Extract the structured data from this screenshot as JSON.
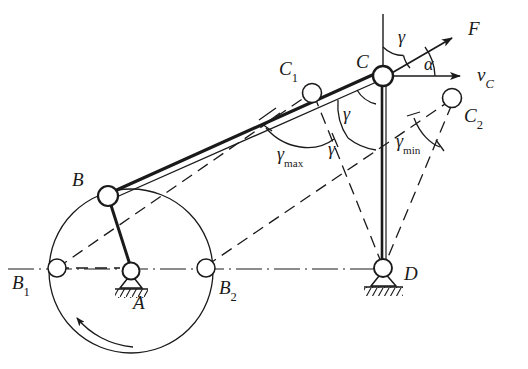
{
  "diagram": {
    "type": "mechanism-kinematic-diagram",
    "stroke_color": "#1a1a1a",
    "background": "#ffffff",
    "labels": {
      "A": "A",
      "B": "B",
      "B1_base": "B",
      "B1_sub": "1",
      "B2_base": "B",
      "B2_sub": "2",
      "C": "C",
      "C1_base": "C",
      "C1_sub": "1",
      "C2_base": "C",
      "C2_sub": "2",
      "D": "D",
      "F": "F",
      "vC_base": "v",
      "vC_sub": "C",
      "gamma_top": "γ",
      "gamma_upper": "γ",
      "gamma_lower": "γ",
      "gamma_max_base": "γ",
      "gamma_max_sub": "max",
      "gamma_min_base": "γ",
      "gamma_min_sub": "min",
      "alpha": "α"
    },
    "points": {
      "A": {
        "x": 131,
        "y": 271,
        "kind": "fixed-pivot"
      },
      "D": {
        "x": 383,
        "y": 268,
        "kind": "fixed-pivot"
      },
      "B": {
        "x": 108,
        "y": 196,
        "kind": "moving-joint"
      },
      "C": {
        "x": 383,
        "y": 76,
        "kind": "moving-joint"
      },
      "B1": {
        "x": 57,
        "y": 268,
        "kind": "limit-position"
      },
      "B2": {
        "x": 206,
        "y": 268,
        "kind": "limit-position"
      },
      "C1": {
        "x": 312,
        "y": 93,
        "kind": "limit-position"
      },
      "C2": {
        "x": 452,
        "y": 98,
        "kind": "limit-position"
      }
    },
    "crank_circle": {
      "cx": 131,
      "cy": 271,
      "r": 82
    },
    "rotation_direction": "counter-clockwise",
    "vectors": {
      "F": {
        "from": [
          383,
          76
        ],
        "to": [
          455,
          35
        ],
        "label": "F"
      },
      "vC": {
        "from": [
          383,
          76
        ],
        "to": [
          464,
          76
        ],
        "label": "v_C"
      }
    },
    "angles": [
      {
        "name": "gamma",
        "at": "C",
        "symbol": "γ"
      },
      {
        "name": "gamma-max",
        "at": "C1",
        "symbol": "γmax"
      },
      {
        "name": "gamma-min",
        "at": "C2",
        "symbol": "γmin"
      },
      {
        "name": "alpha",
        "at": "C",
        "symbol": "α"
      }
    ],
    "label_positions": {
      "A": {
        "x": 133,
        "y": 293
      },
      "B": {
        "x": 72,
        "y": 170
      },
      "B1": {
        "x": 12,
        "y": 273
      },
      "B2": {
        "x": 219,
        "y": 278
      },
      "C": {
        "x": 356,
        "y": 52
      },
      "C1": {
        "x": 279,
        "y": 59
      },
      "C2": {
        "x": 464,
        "y": 106
      },
      "D": {
        "x": 404,
        "y": 264
      },
      "F": {
        "x": 468,
        "y": 19
      },
      "vC": {
        "x": 477,
        "y": 65
      },
      "gtop": {
        "x": 398,
        "y": 28
      },
      "gupper": {
        "x": 343,
        "y": 105
      },
      "glower": {
        "x": 328,
        "y": 140
      },
      "gmax": {
        "x": 277,
        "y": 145
      },
      "gmin": {
        "x": 396,
        "y": 132
      },
      "alpha": {
        "x": 424,
        "y": 55
      }
    }
  }
}
